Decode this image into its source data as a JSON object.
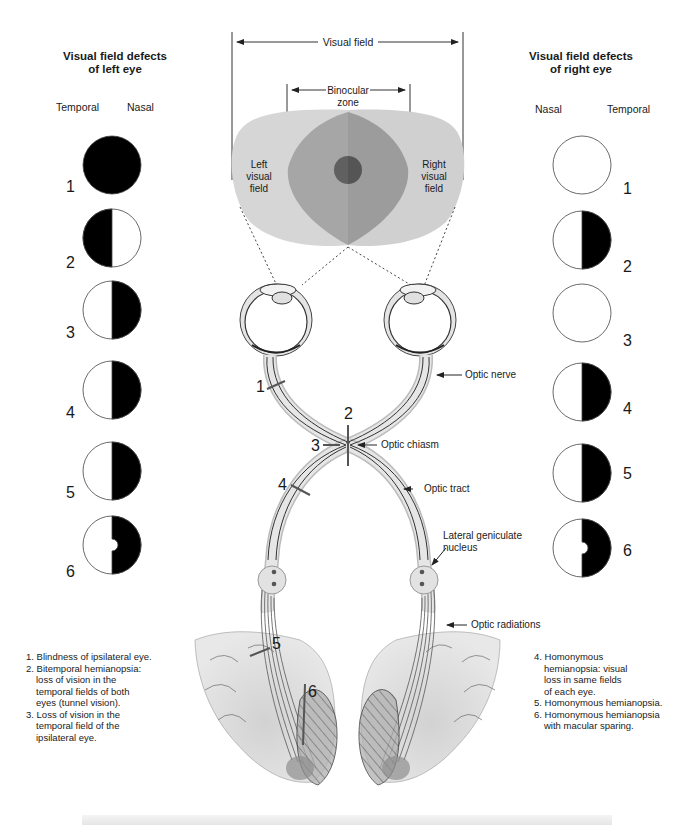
{
  "left_panel": {
    "title_line1": "Visual field defects",
    "title_line2": "of left eye",
    "col_temporal": "Temporal",
    "col_nasal": "Nasal",
    "fields": [
      {
        "num": "1",
        "defect": "full-black"
      },
      {
        "num": "2",
        "defect": "temporal-half-black"
      },
      {
        "num": "3",
        "defect": "nasal-half-black"
      },
      {
        "num": "4",
        "defect": "nasal-half-black"
      },
      {
        "num": "5",
        "defect": "nasal-half-black"
      },
      {
        "num": "6",
        "defect": "nasal-half-black-macular-sparing"
      }
    ]
  },
  "right_panel": {
    "title_line1": "Visual field defects",
    "title_line2": "of right eye",
    "col_nasal": "Nasal",
    "col_temporal": "Temporal",
    "fields": [
      {
        "num": "1",
        "defect": "none"
      },
      {
        "num": "2",
        "defect": "temporal-half-black"
      },
      {
        "num": "3",
        "defect": "none"
      },
      {
        "num": "4",
        "defect": "temporal-half-black"
      },
      {
        "num": "5",
        "defect": "temporal-half-black"
      },
      {
        "num": "6",
        "defect": "temporal-half-black-macular-sparing"
      }
    ]
  },
  "visual_field": {
    "label": "Visual field",
    "binocular_line1": "Binocular",
    "binocular_line2": "zone",
    "left_line1": "Left",
    "left_line2": "visual",
    "left_line3": "field",
    "right_line1": "Right",
    "right_line2": "visual",
    "right_line3": "field",
    "colors": {
      "outer": "#d6d6d6",
      "binocular": "#a3a3a3",
      "macula": "#5e5e5e"
    }
  },
  "pathway_labels": {
    "optic_nerve": "Optic nerve",
    "optic_chiasm": "Optic chiasm",
    "optic_tract": "Optic tract",
    "lgn_line1": "Lateral geniculate",
    "lgn_line2": "nucleus",
    "optic_radiations": "Optic radiations"
  },
  "lesion_markers": [
    "1",
    "2",
    "3",
    "4",
    "5",
    "6"
  ],
  "notes_left": [
    "1. Blindness of ipsilateral eye.",
    "2. Bitemporal hemianopsia:",
    "loss of vision in the",
    "temporal fields of both",
    "eyes (tunnel vision).",
    "3. Loss of vision in the",
    "temporal field of the",
    "ipsilateral eye."
  ],
  "notes_right": [
    "4. Homonymous",
    "hemianopsia: visual",
    "loss in same fields",
    "of each eye.",
    "5. Homonymous hemianopsia.",
    "6. Homonymous hemianopsia",
    "with macular sparing."
  ]
}
